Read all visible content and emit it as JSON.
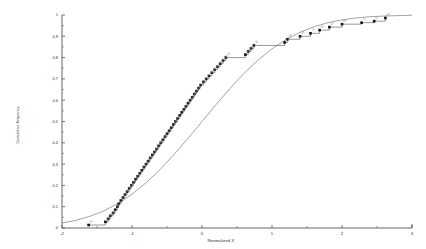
{
  "chart_data": {
    "type": "scatter",
    "title": "",
    "subtitle": "",
    "xlabel": "Normalized X",
    "ylabel": "Cumulative frequency",
    "xlim": [
      -2,
      3
    ],
    "ylim": [
      0,
      1
    ],
    "xticks": [
      -2,
      -1,
      0,
      1,
      2,
      3
    ],
    "xtick_labels": [
      "-2",
      "-1",
      "0",
      "1",
      "2",
      "3"
    ],
    "yticks": [
      0,
      0.1,
      0.2,
      0.3,
      0.4,
      0.5,
      0.6,
      0.7,
      0.8,
      0.9,
      1
    ],
    "ytick_labels": [
      "0",
      "0.1",
      "0.2",
      "0.3",
      "0.4",
      "0.5",
      "0.6",
      "0.7",
      "0.8",
      "0.9",
      "1"
    ],
    "grid": false,
    "minor_ticks": true,
    "legend_position": "none",
    "marker_style": "filled-square",
    "marker_color": "#111111",
    "step_line_color": "#333333",
    "reference_curve_color": "#999999",
    "point_label_color": "#8a8a8a",
    "axis_color": "#555555",
    "series": [
      {
        "name": "Cumulative frequency (observed)",
        "type": "step-scatter",
        "x": [
          -1.62,
          -1.38,
          -1.34,
          -1.31,
          -1.27,
          -1.24,
          -1.21,
          -1.19,
          -1.16,
          -1.13,
          -1.1,
          -1.07,
          -1.04,
          -1.01,
          -0.98,
          -0.95,
          -0.92,
          -0.89,
          -0.86,
          -0.83,
          -0.8,
          -0.77,
          -0.74,
          -0.71,
          -0.68,
          -0.65,
          -0.62,
          -0.59,
          -0.56,
          -0.53,
          -0.5,
          -0.47,
          -0.44,
          -0.41,
          -0.38,
          -0.35,
          -0.32,
          -0.29,
          -0.26,
          -0.23,
          -0.2,
          -0.17,
          -0.14,
          -0.11,
          -0.08,
          -0.05,
          -0.02,
          0.02,
          0.06,
          0.1,
          0.14,
          0.18,
          0.22,
          0.26,
          0.3,
          0.34,
          0.62,
          0.66,
          0.7,
          0.74,
          1.18,
          1.22,
          1.4,
          1.55,
          1.68,
          1.82,
          2.0,
          2.28,
          2.46,
          2.62
        ],
        "y": [
          0.014,
          0.029,
          0.043,
          0.057,
          0.071,
          0.086,
          0.1,
          0.114,
          0.129,
          0.143,
          0.157,
          0.171,
          0.186,
          0.2,
          0.214,
          0.229,
          0.243,
          0.257,
          0.271,
          0.286,
          0.3,
          0.314,
          0.329,
          0.343,
          0.357,
          0.371,
          0.386,
          0.4,
          0.414,
          0.429,
          0.443,
          0.457,
          0.471,
          0.486,
          0.5,
          0.514,
          0.529,
          0.543,
          0.557,
          0.571,
          0.586,
          0.6,
          0.614,
          0.629,
          0.643,
          0.657,
          0.671,
          0.686,
          0.7,
          0.714,
          0.729,
          0.743,
          0.757,
          0.771,
          0.786,
          0.8,
          0.814,
          0.829,
          0.843,
          0.857,
          0.871,
          0.886,
          0.9,
          0.914,
          0.929,
          0.943,
          0.957,
          0.964,
          0.971,
          0.986
        ],
        "point_labels": [
          "37",
          "60",
          "29",
          "45",
          "17",
          "52",
          "38",
          "11",
          "62",
          "25",
          "49",
          "33",
          "58",
          "21",
          "07",
          "44",
          "66",
          "13",
          "50",
          "28",
          "05",
          "41",
          "19",
          "57",
          "34",
          "09",
          "63",
          "23",
          "46",
          "15",
          "31",
          "54",
          "02",
          "40",
          "26",
          "61",
          "18",
          "47",
          "36",
          "10",
          "55",
          "22",
          "43",
          "30",
          "08",
          "59",
          "16",
          "51",
          "27",
          "04",
          "39",
          "64",
          "12",
          "48",
          "32",
          "06",
          "42",
          "20",
          "53",
          "35",
          "01",
          "56",
          "24",
          "14",
          "65",
          "03",
          "68",
          "70",
          "67",
          "69"
        ]
      },
      {
        "name": "Normal CDF reference",
        "type": "line",
        "smooth": true,
        "mean": 0.0,
        "sd": 1.0,
        "x": [
          -2.0,
          -1.8,
          -1.6,
          -1.4,
          -1.2,
          -1.0,
          -0.8,
          -0.6,
          -0.4,
          -0.2,
          0.0,
          0.2,
          0.4,
          0.6,
          0.8,
          1.0,
          1.2,
          1.4,
          1.6,
          1.8,
          2.0,
          2.2,
          2.4,
          2.6,
          2.8,
          3.0
        ],
        "y": [
          0.023,
          0.036,
          0.055,
          0.081,
          0.115,
          0.159,
          0.212,
          0.274,
          0.345,
          0.421,
          0.5,
          0.579,
          0.655,
          0.726,
          0.788,
          0.841,
          0.885,
          0.919,
          0.945,
          0.964,
          0.977,
          0.986,
          0.992,
          0.995,
          0.997,
          0.999
        ]
      }
    ]
  },
  "axes": {
    "x_title": "Normalized X",
    "y_title": "Cumulative frequency"
  }
}
